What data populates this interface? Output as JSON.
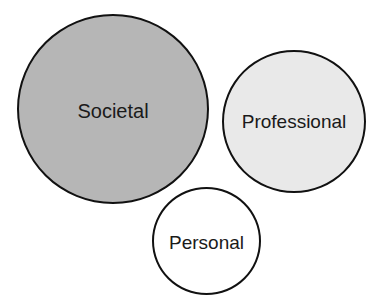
{
  "diagram": {
    "type": "bubble-diagram",
    "nodes": [
      {
        "id": "societal",
        "label": "Societal",
        "fill": "#b6b6b6",
        "size": "large"
      },
      {
        "id": "professional",
        "label": "Professional",
        "fill": "#e9e9e9",
        "size": "medium"
      },
      {
        "id": "personal",
        "label": "Personal",
        "fill": "#ffffff",
        "size": "small"
      }
    ],
    "stroke_color": "#111111"
  }
}
